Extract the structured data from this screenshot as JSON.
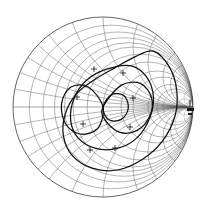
{
  "chart_data": {
    "type": "scatter",
    "title": "",
    "subtitle": "",
    "xlabel": "",
    "ylabel": "",
    "plot_kind": "smith-chart",
    "grid": true,
    "legend": "none",
    "background_color": "#ffffff",
    "grid_color": "#5a5a5a",
    "trace_color": "#111111",
    "outline_color": "#3d3d3d",
    "chart_geometry": {
      "center_x": 103,
      "center_y": 107,
      "radius": 90,
      "units": "normalized-reflection-coefficient"
    },
    "axes": {
      "real_axis_label": "",
      "imag_axis_label": "",
      "xlim": [
        -1,
        1
      ],
      "ylim": [
        -1,
        1
      ]
    },
    "grid_resistance_circles": [
      0.1,
      0.2,
      0.3,
      0.4,
      0.5,
      0.7,
      1.0,
      1.5,
      2.0,
      3.0,
      4.0,
      5.0,
      10.0,
      20.0
    ],
    "grid_reactance_arcs": [
      0.1,
      0.2,
      0.3,
      0.4,
      0.5,
      0.7,
      1.0,
      1.5,
      2.0,
      3.0,
      4.0,
      5.0,
      10.0,
      20.0
    ],
    "series": [
      {
        "name": "trace-outer-loop",
        "description": "large outer resonance loop sweeping upper-right through lower-left",
        "closed": true,
        "points_xy": [
          [
            0.56,
            0.62
          ],
          [
            0.74,
            0.44
          ],
          [
            0.82,
            0.18
          ],
          [
            0.8,
            -0.1
          ],
          [
            0.66,
            -0.38
          ],
          [
            0.44,
            -0.58
          ],
          [
            0.16,
            -0.7
          ],
          [
            -0.12,
            -0.68
          ],
          [
            -0.34,
            -0.54
          ],
          [
            -0.44,
            -0.32
          ],
          [
            -0.42,
            -0.08
          ],
          [
            -0.3,
            0.14
          ],
          [
            -0.1,
            0.3
          ],
          [
            0.14,
            0.44
          ],
          [
            0.36,
            0.56
          ],
          [
            0.56,
            0.62
          ]
        ]
      },
      {
        "name": "trace-mid-loop",
        "description": "middle loop centered slightly right of chart center",
        "closed": true,
        "points_xy": [
          [
            0.3,
            0.46
          ],
          [
            0.48,
            0.34
          ],
          [
            0.56,
            0.12
          ],
          [
            0.52,
            -0.12
          ],
          [
            0.38,
            -0.34
          ],
          [
            0.16,
            -0.46
          ],
          [
            -0.08,
            -0.46
          ],
          [
            -0.28,
            -0.34
          ],
          [
            -0.36,
            -0.14
          ],
          [
            -0.32,
            0.1
          ],
          [
            -0.18,
            0.3
          ],
          [
            0.04,
            0.42
          ],
          [
            0.3,
            0.46
          ]
        ]
      },
      {
        "name": "trace-right-petal",
        "description": "right-hand petal terminating at the short-circuit convergence point",
        "closed": true,
        "points_xy": [
          [
            0.0,
            0.0
          ],
          [
            0.2,
            0.24
          ],
          [
            0.42,
            0.26
          ],
          [
            0.54,
            0.1
          ],
          [
            0.52,
            -0.1
          ],
          [
            0.38,
            -0.26
          ],
          [
            0.18,
            -0.28
          ],
          [
            0.02,
            -0.14
          ],
          [
            0.0,
            0.0
          ]
        ]
      },
      {
        "name": "trace-left-petal",
        "description": "left-hand petal terminating at the same convergence point",
        "closed": true,
        "points_xy": [
          [
            0.0,
            0.0
          ],
          [
            -0.16,
            0.22
          ],
          [
            -0.36,
            0.22
          ],
          [
            -0.46,
            0.04
          ],
          [
            -0.42,
            -0.18
          ],
          [
            -0.26,
            -0.3
          ],
          [
            -0.06,
            -0.24
          ],
          [
            0.0,
            0.0
          ]
        ]
      },
      {
        "name": "trace-inner-lobe",
        "description": "small inner lobe near chart center",
        "closed": true,
        "points_xy": [
          [
            0.0,
            0.0
          ],
          [
            0.1,
            0.14
          ],
          [
            0.24,
            0.12
          ],
          [
            0.28,
            -0.02
          ],
          [
            0.2,
            -0.14
          ],
          [
            0.06,
            -0.14
          ],
          [
            0.0,
            0.0
          ]
        ]
      }
    ],
    "markers": [
      {
        "label": "+",
        "x": 0.22,
        "y": 0.38,
        "pixel": [
          123,
          73
        ]
      },
      {
        "label": "+",
        "x": -0.1,
        "y": 0.42,
        "pixel": [
          94,
          69
        ]
      },
      {
        "label": "+",
        "x": 0.33,
        "y": 0.1,
        "pixel": [
          133,
          98
        ]
      },
      {
        "label": "+",
        "x": -0.29,
        "y": 0.11,
        "pixel": [
          77,
          97
        ]
      },
      {
        "label": "+",
        "x": 0.3,
        "y": -0.22,
        "pixel": [
          130,
          127
        ]
      },
      {
        "label": "+",
        "x": -0.22,
        "y": -0.19,
        "pixel": [
          83,
          124
        ]
      },
      {
        "label": "+",
        "x": 0.13,
        "y": -0.46,
        "pixel": [
          115,
          148
        ]
      },
      {
        "label": "+",
        "x": -0.14,
        "y": -0.48,
        "pixel": [
          90,
          150
        ]
      }
    ],
    "edge_annotation": {
      "label": "",
      "icon": "edge-tick-marker",
      "pixel": [
        191,
        110
      ]
    }
  },
  "figure": {
    "caption": "",
    "accessible_name": "smith-chart"
  }
}
